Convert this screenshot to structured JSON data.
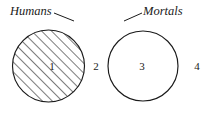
{
  "diagram": {
    "type": "venn-two-set",
    "title_visible": false,
    "background_color": "#ffffff",
    "stroke_color": "#1a1a1a",
    "sets": [
      {
        "id": "humans",
        "label": "Humans",
        "label_style": "italic-serif",
        "label_x": 10,
        "label_y": 15,
        "cx": 48.5,
        "cy": 66,
        "r": 36,
        "shaded": true,
        "shading": "diagonal-hatch-45"
      },
      {
        "id": "mortals",
        "label": "Mortals",
        "label_style": "italic-serif",
        "label_x": 143,
        "label_y": 15,
        "cx": 143,
        "cy": 66,
        "r": 35,
        "shaded": false,
        "shading": "none"
      }
    ],
    "regions": [
      {
        "id": "region-1",
        "number": "1",
        "meaning": "humans-only",
        "x": 52,
        "y": 70,
        "shaded": true
      },
      {
        "id": "region-2",
        "number": "2",
        "meaning": "humans-and-mortals",
        "x": 96,
        "y": 70,
        "shaded": false
      },
      {
        "id": "region-3",
        "number": "3",
        "meaning": "mortals-only",
        "x": 142,
        "y": 70,
        "shaded": false
      },
      {
        "id": "region-4",
        "number": "4",
        "meaning": "outside-both",
        "x": 197,
        "y": 70,
        "shaded": false
      }
    ]
  }
}
